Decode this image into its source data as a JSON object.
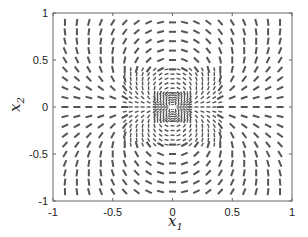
{
  "chart_data": {
    "type": "line-field",
    "title": "",
    "xlabel": "x1",
    "ylabel": "x2",
    "xlabel_main": "x",
    "xlabel_sub": "1",
    "ylabel_main": "x",
    "ylabel_sub": "2",
    "xlim": [
      -1,
      1
    ],
    "ylim": [
      -1,
      1
    ],
    "xticks": [
      -1,
      -0.5,
      0,
      0.5,
      1
    ],
    "yticks": [
      -1,
      -0.5,
      0,
      0.5,
      1
    ],
    "xtick_labels": [
      "-1",
      "-0.5",
      "0",
      "0.5",
      "1"
    ],
    "ytick_labels": [
      "-1",
      "-0.5",
      "0",
      "0.5",
      "1"
    ],
    "grid": false,
    "legend": null,
    "field": {
      "description": "Orientation field with segment angle = 2*atan2(x2, x1); multi-resolution sampling grid refined toward the origin",
      "angle_rule": "phi = 2*theta",
      "levels": [
        {
          "range": [
            -0.9,
            0.9
          ],
          "step": 0.1,
          "exclude_inner": 0.4,
          "seg_len_px": 7,
          "stroke_px": 2.0
        },
        {
          "range": [
            -0.4,
            0.4
          ],
          "step": 0.05,
          "exclude_inner": 0.15,
          "seg_len_px": 4,
          "stroke_px": 1.4
        },
        {
          "range": [
            -0.15,
            0.15
          ],
          "step": 0.025,
          "exclude_inner": 0.0,
          "seg_len_px": 3,
          "stroke_px": 1.3
        }
      ],
      "center_hole": {
        "x": 0,
        "y": 0,
        "rx": 0.035,
        "ry": 0.025,
        "color": "#ffffff"
      },
      "segment_color": "#555555"
    },
    "colors": {
      "axes": "#555555",
      "segments": "#555555",
      "background": "#ffffff"
    }
  }
}
